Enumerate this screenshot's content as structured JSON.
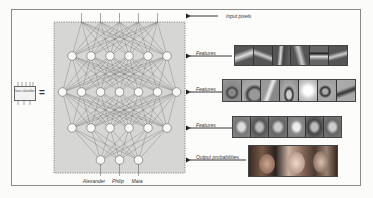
{
  "diagram": {
    "classifier_chip_label": "face classifier",
    "equals_sign": "=",
    "annotations": [
      {
        "id": "input",
        "label": "Input pixels"
      },
      {
        "id": "features1",
        "label": "Features"
      },
      {
        "id": "features2",
        "label": "Features"
      },
      {
        "id": "features3",
        "label": "Features"
      },
      {
        "id": "output",
        "label": "Output probabilities"
      }
    ],
    "network": {
      "input_lines": 5,
      "layers": [
        6,
        7,
        6,
        3
      ],
      "output_labels": [
        "Alexander",
        "Philip",
        "Maia"
      ]
    },
    "feature_strips": [
      {
        "name": "edge-features",
        "tiles": 6,
        "description": "oriented edge filters"
      },
      {
        "name": "part-features",
        "tiles": 7,
        "description": "facial part patterns (eyes, nose, curves)"
      },
      {
        "name": "face-features",
        "tiles": 6,
        "description": "whole-face templates"
      }
    ],
    "output_photo": {
      "description": "photo of three children's faces"
    },
    "colors": {
      "panel_fill": "#d6d6d4",
      "panel_border": "#777777",
      "node_fill": "#f8f8f6",
      "edge": "#6a6a6a",
      "arrow": "#222222",
      "frame_border": "#8a8a8a"
    }
  }
}
